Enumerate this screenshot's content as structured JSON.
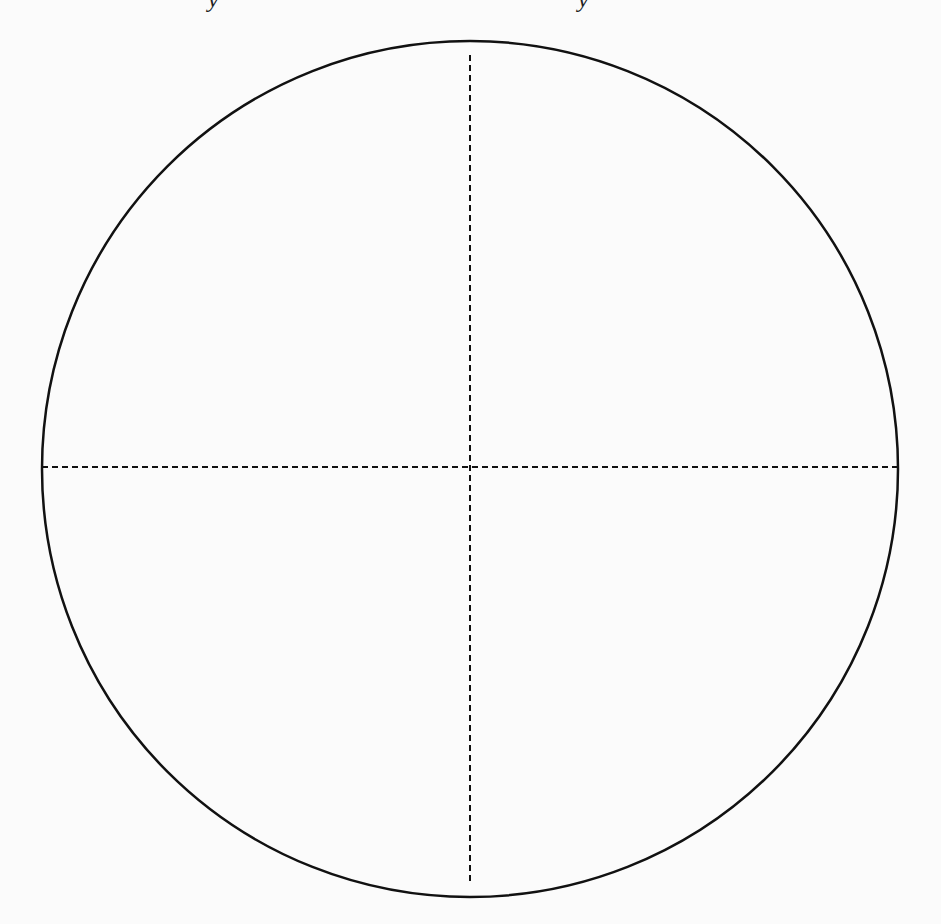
{
  "page": {
    "background": "#fbfbfb"
  },
  "top_fragments": [
    {
      "glyph": "y",
      "x": 208
    },
    {
      "glyph": "y",
      "x": 578
    }
  ],
  "diagram": {
    "type": "circle-with-crosshairs",
    "circle": {
      "cx": 470,
      "cy": 469,
      "r": 428,
      "stroke": "#111111",
      "stroke_width": 2.5
    },
    "horizontal_axis": {
      "x1": 42,
      "y1": 467,
      "x2": 899,
      "y2": 467,
      "style": "dashed",
      "stroke": "#111111"
    },
    "vertical_axis": {
      "x1": 470,
      "y1": 55,
      "x2": 470,
      "y2": 883,
      "style": "dashed",
      "stroke": "#111111"
    },
    "dash_pattern": "6 4"
  }
}
